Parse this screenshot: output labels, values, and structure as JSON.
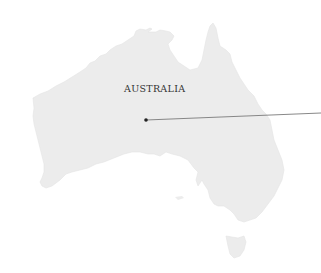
{
  "map": {
    "region_label": "AUSTRALIA",
    "land_color": "#ececec",
    "land_outline_color": "#e2e2e2",
    "background_color": "#ffffff",
    "label_color": "#333333",
    "marker": {
      "x": 146,
      "y": 120,
      "color": "#222222"
    },
    "leader_line": {
      "x1": 146,
      "y1": 120,
      "x2": 321,
      "y2": 113,
      "color": "#7a7a7a"
    },
    "landmasses": [
      "mainland",
      "tasmania"
    ]
  }
}
